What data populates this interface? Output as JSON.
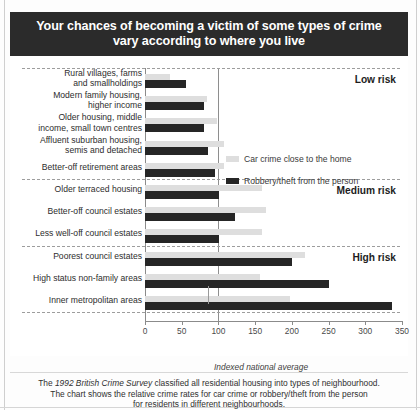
{
  "title": {
    "line1": "Your chances of becoming a victim of some types of crime",
    "line2": "vary according to where you live",
    "background_color": "#2b2b2b",
    "text_color": "#ffffff"
  },
  "legend": {
    "items": [
      {
        "label": "Car crime close to the home",
        "color": "#dedede"
      },
      {
        "label": "Robbery/theft from the person",
        "color": "#262626"
      }
    ]
  },
  "risk_bands": [
    {
      "label": "Low risk"
    },
    {
      "label": "Medium risk"
    },
    {
      "label": "High risk"
    }
  ],
  "axis": {
    "caption": "Indexed national average",
    "average_value": 100,
    "ticks": [
      0,
      50,
      100,
      150,
      200,
      250,
      300,
      350
    ]
  },
  "footer": {
    "line1_pre": "The ",
    "line1_em": "1992 British Crime Survey",
    "line1_post": " classified all residential housing into types of neighbourhood.",
    "line2": "The chart shows the relative crime rates for car crime or robbery/theft from the person",
    "line3": "for residents in different neighbourhoods."
  },
  "chart_data": {
    "type": "bar",
    "orientation": "horizontal",
    "title": "Your chances of becoming a victim of some types of crime vary according to where you live",
    "xlabel": "Indexed national average",
    "ylabel": "",
    "xlim": [
      0,
      350
    ],
    "xticks": [
      0,
      50,
      100,
      150,
      200,
      250,
      300,
      350
    ],
    "grid": false,
    "legend_position": "upper-right",
    "reference_line": {
      "value": 100,
      "label": "Indexed national average"
    },
    "categories": [
      "Rural villages, farms and smallholdings",
      "Modern family housing, higher income",
      "Older housing, middle income, small town centres",
      "Affluent suburban housing, semis and detached",
      "Better-off retirement areas",
      "Older terraced housing",
      "Better-off council estates",
      "Less well-off council estates",
      "Poorest council estates",
      "High status non-family areas",
      "Inner metropolitan areas"
    ],
    "category_bands": [
      "Low risk",
      "Low risk",
      "Low risk",
      "Low risk",
      "Low risk",
      "Medium risk",
      "Medium risk",
      "Medium risk",
      "High risk",
      "High risk",
      "High risk"
    ],
    "series": [
      {
        "name": "Car crime close to the home",
        "color": "#dedede",
        "values": [
          34,
          85,
          98,
          108,
          108,
          160,
          165,
          160,
          218,
          157,
          198
        ]
      },
      {
        "name": "Robbery/theft from the person",
        "color": "#262626",
        "values": [
          56,
          80,
          80,
          86,
          96,
          101,
          122,
          101,
          200,
          250,
          336
        ]
      }
    ]
  },
  "rows": [
    {
      "label_line1": "Rural villages, farms",
      "label_line2": "and smallholdings"
    },
    {
      "label_line1": "Modern family housing,",
      "label_line2": "higher income"
    },
    {
      "label_line1": "Older housing, middle",
      "label_line2": "income, small town centres"
    },
    {
      "label_line1": "Affluent suburban housing,",
      "label_line2": "semis and detached"
    },
    {
      "label_line1": "Better-off retirement areas",
      "label_line2": ""
    },
    {
      "label_line1": "Older terraced housing",
      "label_line2": ""
    },
    {
      "label_line1": "Better-off council estates",
      "label_line2": ""
    },
    {
      "label_line1": "Less well-off council estates",
      "label_line2": ""
    },
    {
      "label_line1": "Poorest council estates",
      "label_line2": ""
    },
    {
      "label_line1": "High status non-family areas",
      "label_line2": ""
    },
    {
      "label_line1": "Inner metropolitan areas",
      "label_line2": ""
    }
  ]
}
